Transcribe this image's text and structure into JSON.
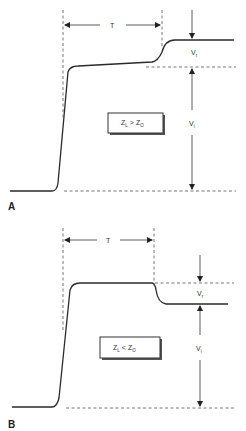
{
  "figure": {
    "panels": [
      {
        "id": "A",
        "label": "A",
        "condition": {
          "main": "Z",
          "sub1": "L",
          "op": ">",
          "main2": "Z",
          "sub2": "O"
        },
        "time_label": "T",
        "reflected_label": {
          "main": "V",
          "sub": "r"
        },
        "incident_label": {
          "main": "V",
          "sub": "i"
        },
        "description": "Reflected step rises above incident level"
      },
      {
        "id": "B",
        "label": "B",
        "condition": {
          "main": "Z",
          "sub1": "L",
          "op": "<",
          "main2": "Z",
          "sub2": "O"
        },
        "time_label": "T",
        "reflected_label": {
          "main": "V",
          "sub": "r"
        },
        "incident_label": {
          "main": "V",
          "sub": "i"
        },
        "description": "Reflected step drops below incident level"
      }
    ]
  }
}
